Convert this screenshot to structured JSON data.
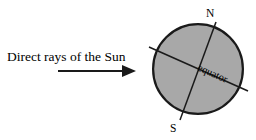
{
  "diagram": {
    "background_color": "#ffffff",
    "annotations": {
      "sun_rays_label": "Direct rays of the Sun",
      "north_pole_label": "N",
      "south_pole_label": "S",
      "equator_label": "equator"
    },
    "colors": {
      "globe_fill": "#a8a8a8",
      "globe_outline": "#1a1a1a",
      "line": "#1a1a1a",
      "text": "#000000"
    },
    "globe": {
      "center_x": 198,
      "center_y": 69,
      "radius": 46,
      "outline_width": 2.2
    },
    "sun_ray_arrow": {
      "start_x": 58,
      "start_y": 71,
      "end_x": 136,
      "end_y": 71,
      "shaft_width": 2,
      "head_length": 14,
      "head_width": 12
    },
    "axis_line": {
      "label_north": "N",
      "label_south": "S",
      "north_x": 216,
      "north_y": 22,
      "south_x": 180,
      "south_y": 120,
      "tilt_degrees": 20,
      "stroke_width": 1.5
    },
    "equator_line": {
      "left_x": 149,
      "left_y": 47,
      "right_x": 248,
      "right_y": 91,
      "stroke_width": 1.5
    }
  }
}
